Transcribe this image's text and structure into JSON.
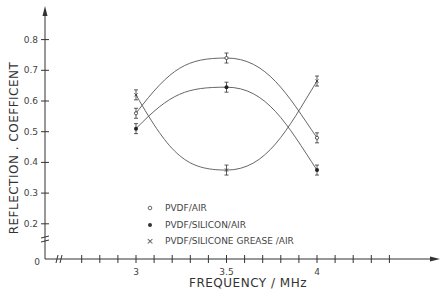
{
  "chart_data": {
    "type": "line",
    "title": "",
    "xlabel": "FREQUENCY / MHz",
    "ylabel": "REFLECTION . COEFFICENT",
    "x": [
      3,
      3.5,
      4
    ],
    "x_ticks": [
      "3",
      "3.5",
      "4"
    ],
    "y_ticks": [
      "0",
      "0.2",
      "0.3",
      "0.4",
      "0.5",
      "0.6",
      "0.7",
      "0.8"
    ],
    "xlim": [
      2.9,
      4.6
    ],
    "ylim": [
      0,
      0.8
    ],
    "axis_breaks": true,
    "grid": false,
    "legend_position": "lower-center",
    "series": [
      {
        "name": "PVDF/AIR",
        "marker": "open-circle",
        "values": [
          0.56,
          0.74,
          0.48
        ]
      },
      {
        "name": "PVDF/SILICON/AIR",
        "marker": "filled-circle",
        "values": [
          0.51,
          0.645,
          0.375
        ]
      },
      {
        "name": "PVDF/SILICONE GREASE /AIR",
        "marker": "cross",
        "values": [
          0.62,
          0.375,
          0.665
        ]
      }
    ]
  },
  "legend": {
    "items": [
      {
        "symbol": "○",
        "label": "PVDF/AIR"
      },
      {
        "symbol": "●",
        "label": "PVDF/SILICON/AIR"
      },
      {
        "symbol": "×",
        "label": "PVDF/SILICONE GREASE /AIR"
      }
    ]
  },
  "axes": {
    "x_title": "FREQUENCY / MHz",
    "y_title": "REFLECTION . COEFFICENT",
    "origin_label": "0"
  }
}
